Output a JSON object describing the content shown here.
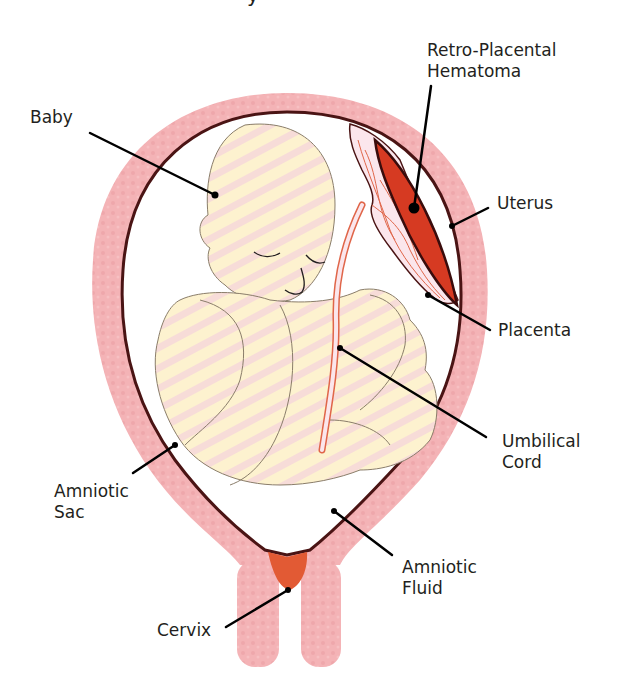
{
  "title_fragment": "y",
  "colors": {
    "uterus": "#f4b3b6",
    "uterus_stripe": "#eea4a9",
    "sac_outline": "#4a1414",
    "baby_fill": "#fdf2cf",
    "baby_stripe": "#f8d8d6",
    "baby_outline": "#8a7d6a",
    "hematoma": "#d63a22",
    "placenta_fill": "#fbe6ec",
    "vessel": "#e0664a",
    "cervix": "#e25a34",
    "leader": "#000000",
    "text": "#231f20"
  },
  "labels": {
    "baby": "Baby",
    "hematoma_line1": "Retro-Placental",
    "hematoma_line2": "Hematoma",
    "uterus": "Uterus",
    "placenta": "Placenta",
    "umbilical_line1": "Umbilical",
    "umbilical_line2": "Cord",
    "amniotic_sac_line1": "Amniotic",
    "amniotic_sac_line2": "Sac",
    "amniotic_fluid_line1": "Amniotic",
    "amniotic_fluid_line2": "Fluid",
    "cervix": "Cervix"
  }
}
